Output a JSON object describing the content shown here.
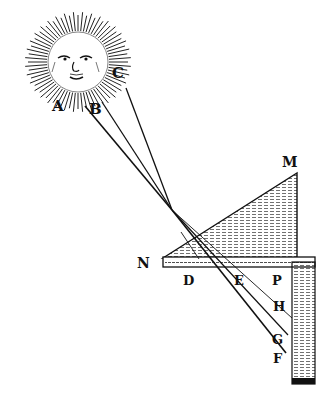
{
  "diagram": {
    "type": "optics-engraving",
    "labels": {
      "A": "A",
      "B": "B",
      "C": "C",
      "M": "M",
      "N": "N",
      "D": "D",
      "E": "E",
      "P": "P",
      "H": "H",
      "G": "G",
      "F": "F"
    },
    "colors": {
      "ink": "#111111",
      "paper": "#ffffff"
    }
  }
}
